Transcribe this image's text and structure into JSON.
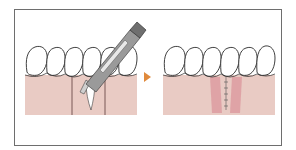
{
  "figure": {
    "title": "",
    "description": "Two-step dental procedure illustration: incision with scalpel between teeth, then sutured gum",
    "panels": [
      {
        "id": "before",
        "label": "",
        "elements": [
          "teeth-row",
          "gum",
          "incision-lines",
          "exposed-root",
          "scalpel"
        ]
      },
      {
        "id": "after",
        "label": "",
        "elements": [
          "teeth-row",
          "gum",
          "healing-tissue",
          "suture-line"
        ]
      }
    ],
    "arrow": {
      "direction": "right",
      "color": "#e08a3c"
    }
  },
  "colors": {
    "frame": "#6e6e6e",
    "gum": "#e9cbc4",
    "gum_dark": "#de9ea3",
    "tooth": "#ffffff",
    "outline": "#2a2a2a",
    "instrument": "#9a9a9a",
    "instrument_dark": "#5f5f5f",
    "arrow": "#e08a3c"
  }
}
